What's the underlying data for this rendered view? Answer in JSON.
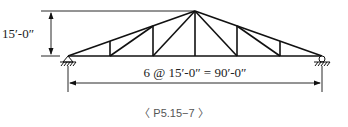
{
  "diagram": {
    "type": "truss",
    "height_label": "15′-0″",
    "span_label": "6 @ 15′-0″ = 90′-0″",
    "caption": "〈 P5.15−7 〉",
    "panels": 6,
    "panel_length": "15′-0″",
    "total_span": "90′-0″",
    "height": "15′-0″",
    "colors": {
      "line": "#111111",
      "caption": "#555555"
    }
  }
}
